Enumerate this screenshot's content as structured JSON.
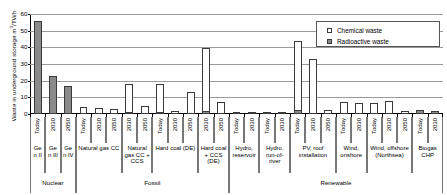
{
  "chart_data": {
    "type": "bar",
    "title": "",
    "xlabel": "",
    "ylabel_text": "Waste in underground storage  m",
    "ylabel_sup": "3",
    "ylabel_tail": "/TWh",
    "ylim": [
      0,
      60
    ],
    "yticks": [
      0,
      10,
      20,
      30,
      40,
      50,
      60
    ],
    "grid": true,
    "legend_position": "top-right",
    "series": [
      {
        "name": "Chemical waste",
        "key": "chemical",
        "marker": "open-square",
        "color": "#ffffff"
      },
      {
        "name": "Radioactive waste",
        "key": "radioactive",
        "marker": "filled-square",
        "color": "#8a8a8a"
      }
    ],
    "categories": [
      {
        "category": "Nuclear",
        "technologies": [
          {
            "tech": "Gen II",
            "bars": [
              {
                "year": "Today",
                "chemical": 0,
                "radioactive": 56
              }
            ]
          },
          {
            "tech": "Gen III",
            "bars": [
              {
                "year": "2030",
                "chemical": 0,
                "radioactive": 23
              }
            ]
          },
          {
            "tech": "Gen IV",
            "bars": [
              {
                "year": "2050",
                "chemical": 0,
                "radioactive": 17
              }
            ]
          }
        ]
      },
      {
        "category": "Fossil",
        "technologies": [
          {
            "tech": "Natural gas CC",
            "bars": [
              {
                "year": "Today",
                "chemical": 4.2,
                "radioactive": 0
              },
              {
                "year": "2030",
                "chemical": 3.6,
                "radioactive": 0
              },
              {
                "year": "2050",
                "chemical": 3.3,
                "radioactive": 0
              }
            ]
          },
          {
            "tech": "Natural gas CC + CCS",
            "bars": [
              {
                "year": "2030",
                "chemical": 18.0,
                "radioactive": 1.0
              },
              {
                "year": "2050",
                "chemical": 4.6,
                "radioactive": 0
              }
            ]
          },
          {
            "tech": "Hard coal (DE)",
            "bars": [
              {
                "year": "Today",
                "chemical": 18.0,
                "radioactive": 0.6
              },
              {
                "year": "2030",
                "chemical": 1.6,
                "radioactive": 0
              },
              {
                "year": "2050",
                "chemical": 13.5,
                "radioactive": 0
              }
            ]
          },
          {
            "tech": "Hard coal + CCS (DE)",
            "bars": [
              {
                "year": "2030",
                "chemical": 39.5,
                "radioactive": 1.6
              },
              {
                "year": "2050",
                "chemical": 7.0,
                "radioactive": 0
              }
            ]
          }
        ]
      },
      {
        "category": "Renewable",
        "technologies": [
          {
            "tech": "Hydro, reservoir",
            "bars": [
              {
                "year": "Today",
                "chemical": 0.5,
                "radioactive": 0
              },
              {
                "year": "2030",
                "chemical": 0.5,
                "radioactive": 0
              }
            ]
          },
          {
            "tech": "Hydro, run-of-river",
            "bars": [
              {
                "year": "Today",
                "chemical": 0.5,
                "radioactive": 0
              },
              {
                "year": "2030",
                "chemical": 0.5,
                "radioactive": 0
              }
            ]
          },
          {
            "tech": "PV, roof installation",
            "bars": [
              {
                "year": "Today",
                "chemical": 44.0,
                "radioactive": 2.2
              },
              {
                "year": "2030",
                "chemical": 33.0,
                "radioactive": 0
              },
              {
                "year": "2050",
                "chemical": 2.4,
                "radioactive": 0
              }
            ]
          },
          {
            "tech": "Wind, onshore",
            "bars": [
              {
                "year": "Today",
                "chemical": 7.0,
                "radioactive": 0
              },
              {
                "year": "2030",
                "chemical": 6.6,
                "radioactive": 0
              }
            ]
          },
          {
            "tech": "Wind, offshore (Northsea)",
            "bars": [
              {
                "year": "Today",
                "chemical": 6.4,
                "radioactive": 0
              },
              {
                "year": "2030",
                "chemical": 7.6,
                "radioactive": 0
              },
              {
                "year": "2050",
                "chemical": 2.0,
                "radioactive": 0
              }
            ]
          },
          {
            "tech": "Biogas CHP",
            "bars": [
              {
                "year": "Today",
                "chemical": 0,
                "radioactive": 2.2
              },
              {
                "year": "2030",
                "chemical": 0,
                "radioactive": 2.0
              }
            ]
          }
        ]
      }
    ]
  }
}
